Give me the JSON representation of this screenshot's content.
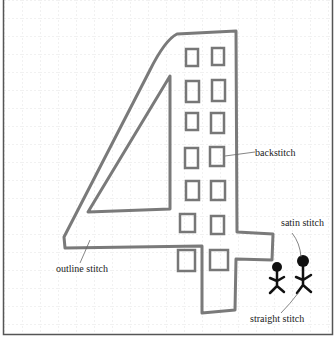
{
  "diagram": {
    "colors": {
      "background": "#ffffff",
      "grid": "#e4e4e4",
      "frame": "#555555",
      "outline": "#7a7a7a",
      "figure": "#111111",
      "leader": "#666666",
      "label": "#222222"
    },
    "labels": {
      "backstitch": "backstitch",
      "outline_stitch": "outline stitch",
      "satin_stitch": "satin stitch",
      "straight_stitch": "straight stitch"
    }
  }
}
